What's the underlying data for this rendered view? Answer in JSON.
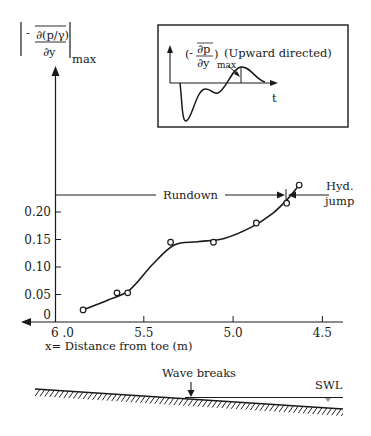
{
  "chart_data": {
    "type": "scatter",
    "title": "",
    "ylabel": {
      "prefix": "-",
      "numerator": "∂(p/γ)",
      "denominator": "∂y",
      "subscript": "max"
    },
    "xlabel": "x= Distance from toe (m)",
    "xlim": [
      6.0,
      4.5
    ],
    "ylim": [
      0,
      0.25
    ],
    "x_inverted": true,
    "x_ticks": [
      6.0,
      5.5,
      5.0,
      4.5
    ],
    "x_tick_labels": [
      "6 .0",
      "5.5",
      "5.0",
      "4.5"
    ],
    "y_ticks": [
      0,
      0.05,
      0.1,
      0.15,
      0.2
    ],
    "y_tick_labels": [
      "0",
      "0.05",
      "0.10",
      "0.15",
      "0.20"
    ],
    "grid": false,
    "series": [
      {
        "name": "measured",
        "marker": "open-circle",
        "x": [
          5.84,
          5.65,
          5.59,
          5.35,
          5.11,
          4.87,
          4.7,
          4.63
        ],
        "y": [
          0.022,
          0.053,
          0.053,
          0.145,
          0.145,
          0.18,
          0.216,
          0.249
        ]
      },
      {
        "name": "fitted curve",
        "marker": "line",
        "x": [
          5.84,
          5.7,
          5.58,
          5.45,
          5.33,
          5.2,
          5.05,
          4.9,
          4.78,
          4.7,
          4.64
        ],
        "y": [
          0.022,
          0.04,
          0.058,
          0.105,
          0.14,
          0.146,
          0.152,
          0.172,
          0.197,
          0.222,
          0.245
        ]
      }
    ],
    "annotations": {
      "rundown_label": "Rundown",
      "rundown_y": 0.233,
      "rundown_end_x": 4.67,
      "hyd_jump_label_1": "Hyd.",
      "hyd_jump_label_2": "jump"
    },
    "inset": {
      "label_prefix": "-",
      "label_numerator": "∂p",
      "label_denominator": "∂y",
      "label_subscript": "max",
      "label_suffix": "(Upward directed)",
      "t_label": "t"
    },
    "profile": {
      "wave_breaks_label": "Wave breaks",
      "swl_label": "SWL"
    }
  }
}
